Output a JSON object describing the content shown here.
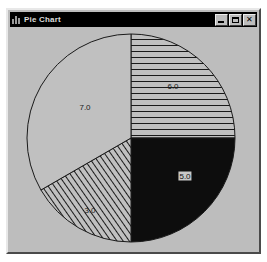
{
  "window": {
    "title": "Pie Chart",
    "icon": "chart-icon",
    "controls": [
      {
        "name": "minimize-button",
        "label": "_",
        "title": "Minimize"
      },
      {
        "name": "maximize-button",
        "label": "□",
        "title": "Maximize"
      },
      {
        "name": "close-button",
        "label": "✕",
        "title": "Close"
      }
    ]
  },
  "colors": {
    "window_face": "#bdbdbd",
    "titlebar": "#000000",
    "titlebar_text": "#dcdcdc",
    "outline": "#1a1a1a",
    "slice_plain": "#c0c0c0",
    "slice_solid": "#0d0d0d",
    "hatch_line": "#1a1a1a",
    "label_text": "#1a1a1a",
    "page_background": "#ffffff"
  },
  "chart_data": {
    "type": "pie",
    "title": "Pie Chart",
    "xlabel": "",
    "ylabel": "",
    "total": 21.0,
    "legend": "none",
    "grid": false,
    "start_angle_deg": 90,
    "direction": "clockwise",
    "categories": [
      "6.0",
      "5.0",
      "3.0",
      "7.0"
    ],
    "values": [
      6.0,
      5.0,
      3.0,
      7.0
    ],
    "labels": [
      "6.0",
      "5.0",
      "3.0",
      "7.0"
    ],
    "slices": [
      {
        "label": "6.0",
        "value": 6.0,
        "fill": "horizontal-hatch",
        "face": "#c0c0c0",
        "start_deg": 90,
        "end_deg": 0,
        "label_x": 163,
        "label_y": 58,
        "label_on_dark": false
      },
      {
        "label": "5.0",
        "value": 5.0,
        "fill": "solid-black",
        "face": "#0d0d0d",
        "start_deg": 0,
        "end_deg": -90,
        "label_x": 175,
        "label_y": 148,
        "label_on_dark": true
      },
      {
        "label": "3.0",
        "value": 3.0,
        "fill": "diagonal-hatch",
        "face": "#c0c0c0",
        "start_deg": -90,
        "end_deg": -150,
        "label_x": 80,
        "label_y": 182,
        "label_on_dark": false
      },
      {
        "label": "7.0",
        "value": 7.0,
        "fill": "plain",
        "face": "#c0c0c0",
        "start_deg": -150,
        "end_deg": -270,
        "label_x": 75,
        "label_y": 79,
        "label_on_dark": false
      }
    ]
  }
}
